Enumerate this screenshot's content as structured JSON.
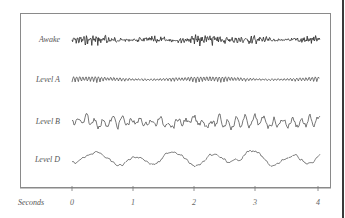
{
  "chart_data": {
    "type": "line",
    "title": "",
    "xlabel": "Seconds",
    "ylabel": "",
    "x_ticks": [
      "0",
      "1",
      "2",
      "3",
      "4"
    ],
    "xlim": [
      0,
      4
    ],
    "grid": false,
    "legend": "none",
    "series": [
      {
        "name": "Awake",
        "description": "low-amplitude, high-frequency irregular activity",
        "amplitude": 4,
        "frequency_hz": 20,
        "color": "#2a2a2a"
      },
      {
        "name": "Level A",
        "description": "regular rhythmic waves (~10 Hz)",
        "amplitude": 4,
        "frequency_hz": 10,
        "color": "#555555"
      },
      {
        "name": "Level B",
        "description": "irregular, moderate amplitude, slower waves",
        "amplitude": 6,
        "frequency_hz": 7,
        "color": "#555555"
      },
      {
        "name": "Level D",
        "description": "slow, large-amplitude waves",
        "amplitude": 7,
        "frequency_hz": 2,
        "color": "#666666"
      }
    ]
  },
  "labels": {
    "awake": "Awake",
    "level_a": "Level A",
    "level_b": "Level B",
    "level_d": "Level D",
    "axis_title": "Seconds",
    "ticks": [
      "0",
      "1",
      "2",
      "3",
      "4"
    ]
  }
}
